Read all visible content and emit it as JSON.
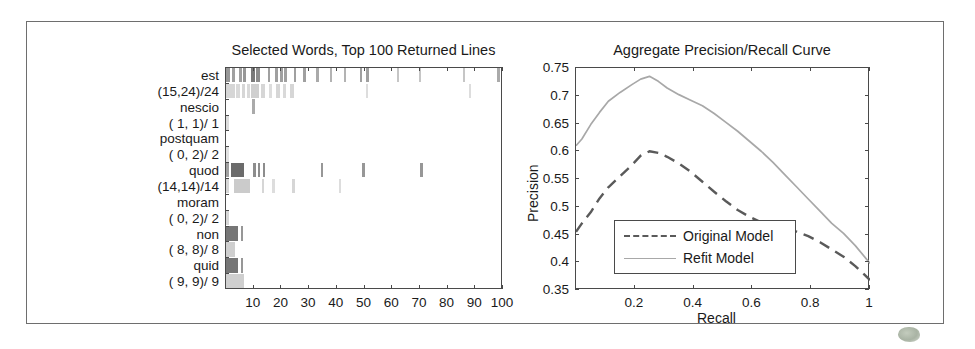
{
  "figure": {
    "border_color": "#6e6e6e",
    "background": "#ffffff"
  },
  "left_panel": {
    "title": "Selected Words, Top 100 Returned Lines",
    "xlabel": "",
    "xticks": [
      "10",
      "20",
      "30",
      "40",
      "50",
      "60",
      "70",
      "80",
      "90",
      "100"
    ],
    "yticks": [
      "est",
      "(15,24)/24",
      "nescio",
      "( 1, 1)/ 1",
      "postquam",
      "( 0, 2)/ 2",
      "quod",
      "(14,14)/14",
      "moram",
      "( 0, 2)/ 2",
      "non",
      "( 8, 8)/ 8",
      "quid",
      "( 9, 9)/ 9"
    ]
  },
  "right_panel": {
    "title": "Aggregate Precision/Recall Curve",
    "xlabel": "Recall",
    "ylabel": "Precision",
    "xticks": [
      "0.2",
      "0.4",
      "0.6",
      "0.8",
      "1"
    ],
    "yticks": [
      "0.75",
      "0.7",
      "0.65",
      "0.6",
      "0.55",
      "0.5",
      "0.45",
      "0.4",
      "0.35"
    ],
    "legend": {
      "items": [
        {
          "label": "Original Model",
          "style": "dashed",
          "color": "#5a5a5a"
        },
        {
          "label": "Refit Model",
          "style": "solid",
          "color": "#a8a8a8"
        }
      ]
    }
  },
  "chart_data": [
    {
      "type": "heatmap",
      "title": "Selected Words, Top 100 Returned Lines",
      "xlabel": "",
      "ylabel": "",
      "xlim": [
        0,
        100
      ],
      "xticks": [
        10,
        20,
        30,
        40,
        50,
        60,
        70,
        80,
        90,
        100
      ],
      "grid": false,
      "row_labels": [
        "est  (15,24)/24",
        "nescio  ( 1, 1)/ 1",
        "postquam  ( 0, 2)/ 2",
        "quod  (14,14)/14",
        "moram  ( 0, 2)/ 2",
        "non  ( 8, 8)/ 8",
        "quid  ( 9, 9)/ 9"
      ],
      "rows": [
        {
          "word": "est",
          "counts": "(15,24)/24",
          "band": "dark",
          "marks": [
            {
              "x": 0.5,
              "w": 1.2,
              "v": 0.55
            },
            {
              "x": 2.6,
              "w": 0.9,
              "v": 0.5
            },
            {
              "x": 5.2,
              "w": 1.0,
              "v": 0.5
            },
            {
              "x": 6.6,
              "w": 1.0,
              "v": 0.55
            },
            {
              "x": 9.4,
              "w": 1.6,
              "v": 0.7
            },
            {
              "x": 11.2,
              "w": 1.4,
              "v": 0.6
            },
            {
              "x": 15.4,
              "w": 1.0,
              "v": 0.5
            },
            {
              "x": 18.2,
              "w": 0.9,
              "v": 0.5
            },
            {
              "x": 20.0,
              "w": 0.9,
              "v": 0.5
            },
            {
              "x": 21.3,
              "w": 0.9,
              "v": 0.5
            },
            {
              "x": 24.8,
              "w": 0.9,
              "v": 0.5
            },
            {
              "x": 28.2,
              "w": 1.0,
              "v": 0.5
            },
            {
              "x": 33.0,
              "w": 0.9,
              "v": 0.45
            },
            {
              "x": 37.8,
              "w": 0.8,
              "v": 0.4
            },
            {
              "x": 43.0,
              "w": 0.8,
              "v": 0.4
            },
            {
              "x": 48.6,
              "w": 1.0,
              "v": 0.5
            },
            {
              "x": 51.0,
              "w": 1.0,
              "v": 0.5
            },
            {
              "x": 62.0,
              "w": 0.7,
              "v": 0.3
            },
            {
              "x": 70.0,
              "w": 0.7,
              "v": 0.3
            },
            {
              "x": 86.0,
              "w": 0.7,
              "v": 0.3
            },
            {
              "x": 98.2,
              "w": 1.0,
              "v": 0.45
            }
          ]
        },
        {
          "word": "est",
          "counts": "(15,24)/24",
          "band": "light",
          "marks": [
            {
              "x": 0.3,
              "w": 3.2,
              "v": 0.3
            },
            {
              "x": 4.0,
              "w": 1.6,
              "v": 0.28
            },
            {
              "x": 6.0,
              "w": 1.4,
              "v": 0.3
            },
            {
              "x": 8.0,
              "w": 1.2,
              "v": 0.28
            },
            {
              "x": 9.4,
              "w": 3.0,
              "v": 0.35
            },
            {
              "x": 13.0,
              "w": 1.6,
              "v": 0.3
            },
            {
              "x": 16.0,
              "w": 1.0,
              "v": 0.25
            },
            {
              "x": 18.4,
              "w": 1.3,
              "v": 0.3
            },
            {
              "x": 21.0,
              "w": 1.1,
              "v": 0.28
            },
            {
              "x": 23.6,
              "w": 1.2,
              "v": 0.3
            },
            {
              "x": 50.8,
              "w": 0.9,
              "v": 0.25
            },
            {
              "x": 88.0,
              "w": 0.9,
              "v": 0.25
            }
          ]
        },
        {
          "word": "nescio",
          "counts": "( 1, 1)/ 1",
          "band": "dark",
          "marks": [
            {
              "x": 9.6,
              "w": 1.1,
              "v": 0.45
            }
          ]
        },
        {
          "word": "nescio",
          "counts": "( 1, 1)/ 1",
          "band": "light",
          "marks": [
            {
              "x": 0.4,
              "w": 1.0,
              "v": 0.25
            }
          ]
        },
        {
          "word": "postquam",
          "counts": "( 0, 2)/ 2",
          "band": "dark",
          "marks": []
        },
        {
          "word": "postquam",
          "counts": "( 0, 2)/ 2",
          "band": "light",
          "marks": [
            {
              "x": 0.4,
              "w": 1.0,
              "v": 0.22
            }
          ]
        },
        {
          "word": "quod",
          "counts": "(14,14)/14",
          "band": "dark",
          "marks": [
            {
              "x": 0.5,
              "w": 1.0,
              "v": 0.5
            },
            {
              "x": 2.0,
              "w": 5.0,
              "v": 0.78
            },
            {
              "x": 10.2,
              "w": 1.0,
              "v": 0.6
            },
            {
              "x": 11.8,
              "w": 1.0,
              "v": 0.6
            },
            {
              "x": 13.6,
              "w": 1.0,
              "v": 0.6
            },
            {
              "x": 34.5,
              "w": 0.9,
              "v": 0.55
            },
            {
              "x": 49.5,
              "w": 0.9,
              "v": 0.55
            },
            {
              "x": 70.5,
              "w": 0.9,
              "v": 0.55
            }
          ]
        },
        {
          "word": "quod",
          "counts": "(14,14)/14",
          "band": "light",
          "marks": [
            {
              "x": 0.3,
              "w": 1.0,
              "v": 0.3
            },
            {
              "x": 3.4,
              "w": 5.6,
              "v": 0.38
            },
            {
              "x": 13.2,
              "w": 1.0,
              "v": 0.3
            },
            {
              "x": 17.0,
              "w": 0.9,
              "v": 0.25
            },
            {
              "x": 24.0,
              "w": 1.1,
              "v": 0.3
            },
            {
              "x": 41.0,
              "w": 0.9,
              "v": 0.25
            }
          ]
        },
        {
          "word": "moram",
          "counts": "( 0, 2)/ 2",
          "band": "dark",
          "marks": []
        },
        {
          "word": "moram",
          "counts": "( 0, 2)/ 2",
          "band": "light",
          "marks": [
            {
              "x": 0.3,
              "w": 1.3,
              "v": 0.3
            }
          ]
        },
        {
          "word": "non",
          "counts": "( 8, 8)/ 8",
          "band": "dark",
          "marks": [
            {
              "x": 0.3,
              "w": 4.4,
              "v": 0.72
            },
            {
              "x": 5.6,
              "w": 1.0,
              "v": 0.55
            }
          ]
        },
        {
          "word": "non",
          "counts": "( 8, 8)/ 8",
          "band": "light",
          "marks": [
            {
              "x": 0.3,
              "w": 3.4,
              "v": 0.35
            }
          ]
        },
        {
          "word": "quid",
          "counts": "( 9, 9)/ 9",
          "band": "dark",
          "marks": [
            {
              "x": 0.3,
              "w": 4.4,
              "v": 0.72
            },
            {
              "x": 5.6,
              "w": 1.0,
              "v": 0.55
            }
          ]
        },
        {
          "word": "quid",
          "counts": "( 9, 9)/ 9",
          "band": "light",
          "marks": [
            {
              "x": 0.3,
              "w": 6.6,
              "v": 0.35
            }
          ]
        }
      ]
    },
    {
      "type": "line",
      "title": "Aggregate Precision/Recall Curve",
      "xlabel": "Recall",
      "ylabel": "Precision",
      "xlim": [
        0,
        1
      ],
      "ylim": [
        0.35,
        0.75
      ],
      "xticks": [
        0.2,
        0.4,
        0.6,
        0.8,
        1
      ],
      "yticks": [
        0.35,
        0.4,
        0.45,
        0.5,
        0.55,
        0.6,
        0.65,
        0.7,
        0.75
      ],
      "grid": false,
      "legend_position": "lower-left",
      "series": [
        {
          "name": "Original Model",
          "style": "dashed",
          "color": "#5a5a5a",
          "x": [
            0.0,
            0.02,
            0.05,
            0.08,
            0.11,
            0.15,
            0.19,
            0.22,
            0.25,
            0.28,
            0.31,
            0.35,
            0.39,
            0.43,
            0.47,
            0.51,
            0.55,
            0.59,
            0.63,
            0.67,
            0.71,
            0.75,
            0.79,
            0.83,
            0.87,
            0.91,
            0.95,
            1.0
          ],
          "y": [
            0.455,
            0.47,
            0.49,
            0.515,
            0.535,
            0.555,
            0.575,
            0.592,
            0.6,
            0.597,
            0.59,
            0.578,
            0.563,
            0.545,
            0.527,
            0.51,
            0.494,
            0.482,
            0.472,
            0.466,
            0.462,
            0.455,
            0.447,
            0.436,
            0.423,
            0.41,
            0.393,
            0.368
          ]
        },
        {
          "name": "Refit Model",
          "style": "solid",
          "color": "#a8a8a8",
          "x": [
            0.0,
            0.02,
            0.05,
            0.08,
            0.11,
            0.15,
            0.19,
            0.22,
            0.25,
            0.28,
            0.31,
            0.35,
            0.39,
            0.43,
            0.47,
            0.51,
            0.55,
            0.59,
            0.63,
            0.67,
            0.71,
            0.75,
            0.79,
            0.83,
            0.87,
            0.91,
            0.95,
            1.0
          ],
          "y": [
            0.61,
            0.622,
            0.648,
            0.67,
            0.69,
            0.706,
            0.72,
            0.73,
            0.735,
            0.726,
            0.714,
            0.702,
            0.692,
            0.682,
            0.668,
            0.652,
            0.636,
            0.618,
            0.6,
            0.58,
            0.558,
            0.536,
            0.514,
            0.492,
            0.47,
            0.452,
            0.43,
            0.398
          ]
        }
      ]
    }
  ]
}
